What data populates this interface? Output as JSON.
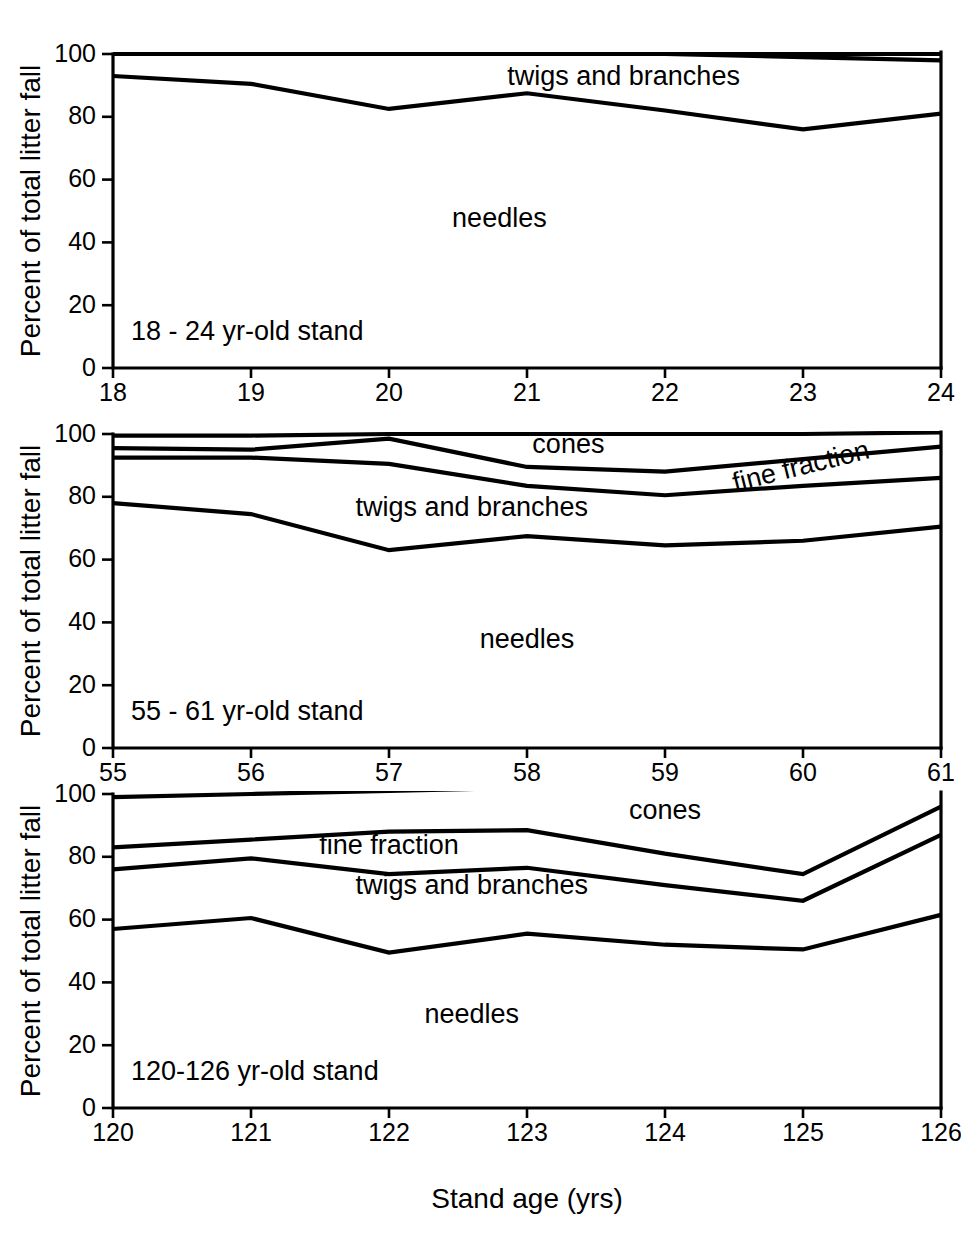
{
  "figure": {
    "xlabel": "Stand age (yrs)",
    "ylabel": "Percent of total litter fall"
  },
  "chart_data": [
    {
      "type": "area",
      "title": "18 - 24 yr-old stand",
      "panel_label": "18 - 24 yr-old stand",
      "xlabel": "",
      "ylabel": "Percent of total litter fall",
      "xlim": [
        18,
        24
      ],
      "ylim": [
        0,
        100
      ],
      "yticks": [
        0,
        20,
        40,
        60,
        80,
        100
      ],
      "xticks": [
        18,
        19,
        20,
        21,
        22,
        23,
        24
      ],
      "xtick_labels": [
        "18",
        "19",
        "20",
        "21",
        "22",
        "23",
        "24"
      ],
      "ytick_labels": [
        "0",
        "20",
        "40",
        "60",
        "80",
        "100"
      ],
      "grid": false,
      "legend": "in-plot region labels",
      "x": [
        18,
        19,
        20,
        21,
        22,
        23,
        24
      ],
      "series": [
        {
          "name": "cumulative top (100%)",
          "values": [
            100,
            100,
            100,
            100,
            100,
            100,
            100
          ]
        },
        {
          "name": "cones + fine fraction boundary",
          "values": [
            100,
            100,
            100,
            100,
            100,
            99,
            98
          ]
        },
        {
          "name": "twigs and branches boundary",
          "values": [
            93,
            90.5,
            82.5,
            87.5,
            82,
            76,
            81
          ]
        }
      ],
      "region_labels": [
        {
          "text": "twigs and branches",
          "x": 21.7,
          "y": 90
        },
        {
          "text": "needles",
          "x": 20.8,
          "y": 45
        }
      ]
    },
    {
      "type": "area",
      "title": "55 - 61 yr-old stand",
      "panel_label": "55 - 61 yr-old stand",
      "xlabel": "",
      "ylabel": "Percent of total litter fall",
      "xlim": [
        55,
        61
      ],
      "ylim": [
        0,
        100
      ],
      "yticks": [
        0,
        20,
        40,
        60,
        80,
        100
      ],
      "xticks": [
        55,
        56,
        57,
        58,
        59,
        60,
        61
      ],
      "xtick_labels": [
        "55",
        "56",
        "57",
        "58",
        "59",
        "60",
        "61"
      ],
      "ytick_labels": [
        "0",
        "20",
        "40",
        "60",
        "80",
        "100"
      ],
      "grid": false,
      "legend": "in-plot region labels",
      "x": [
        55,
        56,
        57,
        58,
        59,
        60,
        61
      ],
      "series": [
        {
          "name": "cumulative top (100%)",
          "values": [
            99.5,
            99.5,
            100,
            100,
            100,
            100,
            100.5
          ]
        },
        {
          "name": "cones boundary",
          "values": [
            95.5,
            95,
            98.5,
            89.5,
            88,
            92,
            96
          ]
        },
        {
          "name": "fine fraction boundary",
          "values": [
            92.5,
            92.5,
            90.5,
            83.5,
            80.5,
            83.5,
            86
          ]
        },
        {
          "name": "twigs and branches boundary",
          "values": [
            78,
            74.5,
            63,
            67.5,
            64.5,
            66,
            70.5
          ]
        }
      ],
      "region_labels": [
        {
          "text": "cones",
          "x": 58.3,
          "y": 94
        },
        {
          "text": "fine fraction",
          "x": 60.0,
          "y": 87,
          "rotate": -14
        },
        {
          "text": "twigs and branches",
          "x": 57.6,
          "y": 74
        },
        {
          "text": "needles",
          "x": 58.0,
          "y": 32
        }
      ]
    },
    {
      "type": "area",
      "title": "120-126 yr-old stand",
      "panel_label": "120-126 yr-old stand",
      "xlabel": "Stand age (yrs)",
      "ylabel": "Percent of total litter fall",
      "xlim": [
        120,
        126
      ],
      "ylim": [
        0,
        100
      ],
      "yticks": [
        0,
        20,
        40,
        60,
        80,
        100
      ],
      "xticks": [
        120,
        121,
        122,
        123,
        124,
        125,
        126
      ],
      "xtick_labels": [
        "120",
        "121",
        "122",
        "123",
        "124",
        "125",
        "126"
      ],
      "ytick_labels": [
        "0",
        "20",
        "40",
        "60",
        "80",
        "100"
      ],
      "grid": false,
      "legend": "in-plot region labels",
      "x": [
        120,
        121,
        122,
        123,
        124,
        125,
        126
      ],
      "series": [
        {
          "name": "cumulative top (100%)",
          "values": [
            99,
            100,
            101,
            102,
            103,
            104,
            105
          ]
        },
        {
          "name": "cones boundary",
          "values": [
            83,
            85.5,
            88,
            88.5,
            81,
            74.5,
            96
          ]
        },
        {
          "name": "fine fraction boundary",
          "values": [
            76,
            79.5,
            74.5,
            76.5,
            71,
            66,
            87
          ]
        },
        {
          "name": "twigs and branches boundary",
          "values": [
            57,
            60.5,
            49.5,
            55.5,
            52,
            50.5,
            61.5
          ]
        }
      ],
      "region_labels": [
        {
          "text": "cones",
          "x": 124.0,
          "y": 92
        },
        {
          "text": "fine fraction",
          "x": 122.0,
          "y": 81
        },
        {
          "text": "twigs and branches",
          "x": 122.6,
          "y": 68
        },
        {
          "text": "needles",
          "x": 122.6,
          "y": 27
        }
      ]
    }
  ]
}
